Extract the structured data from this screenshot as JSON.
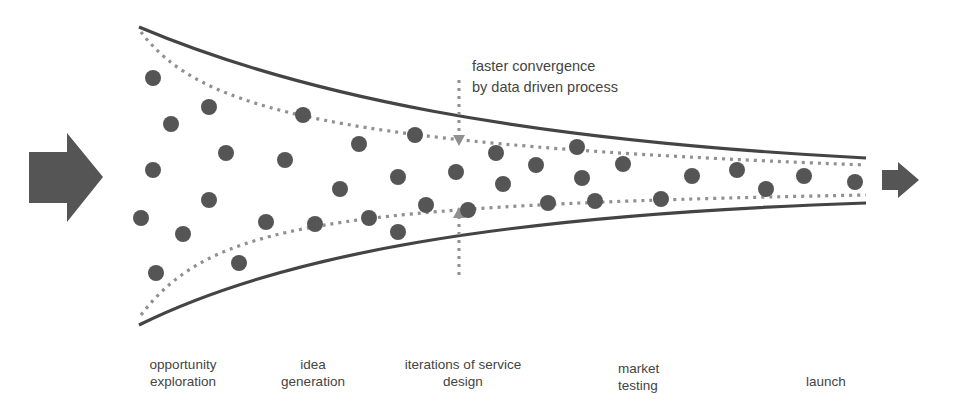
{
  "annotation": {
    "line1": "faster convergence",
    "line2": "by data driven process"
  },
  "stages": [
    {
      "line1": "opportunity",
      "line2": "exploration"
    },
    {
      "line1": "idea",
      "line2": "generation"
    },
    {
      "line1": "iterations of service",
      "line2": "design"
    },
    {
      "line1": "market",
      "line2": "testing"
    },
    {
      "line1": "launch",
      "line2": ""
    }
  ],
  "colors": {
    "funnel_line": "#444444",
    "dotted_line": "#909090",
    "dots": "#555555",
    "arrows": "#555555",
    "text": "#444444"
  },
  "dots": [
    [
      153,
      78
    ],
    [
      171,
      124
    ],
    [
      209,
      107
    ],
    [
      153,
      170
    ],
    [
      226,
      153
    ],
    [
      141,
      218
    ],
    [
      183,
      234
    ],
    [
      209,
      200
    ],
    [
      156,
      273
    ],
    [
      239,
      263
    ],
    [
      303,
      115
    ],
    [
      285,
      160
    ],
    [
      340,
      189
    ],
    [
      266,
      222
    ],
    [
      315,
      224
    ],
    [
      359,
      144
    ],
    [
      369,
      218
    ],
    [
      415,
      135
    ],
    [
      398,
      177
    ],
    [
      398,
      232
    ],
    [
      426,
      205
    ],
    [
      456,
      172
    ],
    [
      468,
      210
    ],
    [
      496,
      153
    ],
    [
      503,
      184
    ],
    [
      536,
      165
    ],
    [
      548,
      203
    ],
    [
      577,
      147
    ],
    [
      582,
      178
    ],
    [
      595,
      201
    ],
    [
      623,
      164
    ],
    [
      661,
      199
    ],
    [
      692,
      176
    ],
    [
      737,
      170
    ],
    [
      766,
      189
    ],
    [
      804,
      176
    ],
    [
      855,
      182
    ]
  ]
}
